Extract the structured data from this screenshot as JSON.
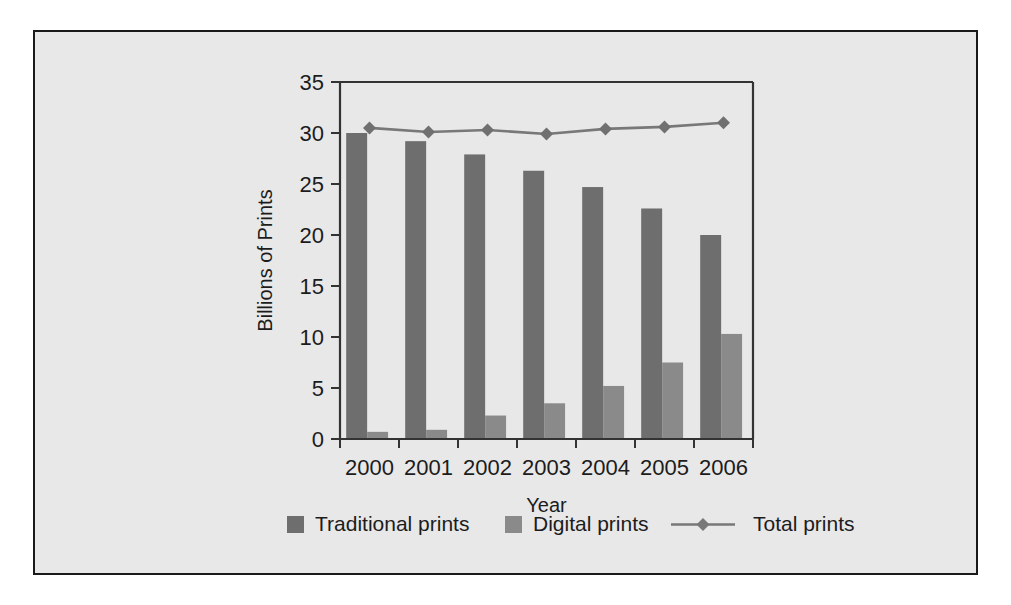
{
  "chart_data": {
    "type": "bar",
    "title": "",
    "subtitle": "",
    "xlabel": "Year",
    "ylabel": "Billions of Prints",
    "categories": [
      "2000",
      "2001",
      "2002",
      "2003",
      "2004",
      "2005",
      "2006"
    ],
    "ylim": [
      0,
      35
    ],
    "yticks": [
      0,
      5,
      10,
      15,
      20,
      25,
      30,
      35
    ],
    "ytick_labels": [
      "0",
      "5",
      "10",
      "15",
      "20",
      "25",
      "30",
      "35"
    ],
    "grid": false,
    "legend_position": "bottom",
    "series": [
      {
        "name": "Traditional prints",
        "kind": "bar",
        "color": "#6e6e6e",
        "values": [
          30.0,
          29.2,
          27.9,
          26.3,
          24.7,
          22.6,
          20.0
        ]
      },
      {
        "name": "Digital prints",
        "kind": "bar",
        "color": "#8a8a8a",
        "values": [
          0.7,
          0.9,
          2.3,
          3.5,
          5.2,
          7.5,
          10.3
        ]
      },
      {
        "name": "Total prints",
        "kind": "line",
        "color": "#787878",
        "marker": "diamond",
        "values": [
          30.5,
          30.1,
          30.3,
          29.9,
          30.4,
          30.6,
          31.0
        ]
      }
    ]
  },
  "legend": {
    "items": [
      {
        "label": "Traditional prints",
        "marker": "square",
        "color": "#6e6e6e"
      },
      {
        "label": "Digital prints",
        "marker": "square",
        "color": "#8a8a8a"
      },
      {
        "label": "Total prints",
        "marker": "line-diamond",
        "color": "#787878"
      }
    ]
  },
  "axes": {
    "x_title": "Year",
    "y_title": "Billions of Prints"
  }
}
